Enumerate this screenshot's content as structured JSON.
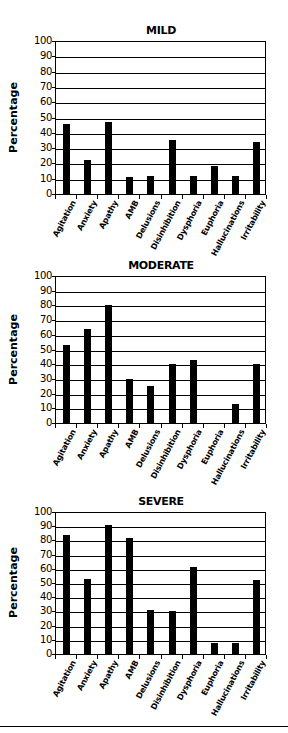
{
  "chart_data": [
    {
      "type": "bar",
      "title": "MILD",
      "xlabel": "",
      "ylabel": "Percentage",
      "ylim": [
        0,
        100
      ],
      "yticks": [
        0,
        10,
        20,
        30,
        40,
        50,
        60,
        70,
        80,
        90,
        100
      ],
      "grid": true,
      "categories": [
        "Agitation",
        "Anxiety",
        "Apathy",
        "AMB",
        "Delusions",
        "Disinhibition",
        "Dysphoria",
        "Euphoria",
        "Hallucinations",
        "Irritability"
      ],
      "values": [
        46,
        22,
        47,
        11,
        12,
        35,
        12,
        18,
        12,
        34
      ]
    },
    {
      "type": "bar",
      "title": "MODERATE",
      "xlabel": "",
      "ylabel": "Percentage",
      "ylim": [
        0,
        100
      ],
      "yticks": [
        0,
        10,
        20,
        30,
        40,
        50,
        60,
        70,
        80,
        90,
        100
      ],
      "grid": true,
      "categories": [
        "Agitation",
        "Anxiety",
        "Apathy",
        "AMB",
        "Delusions",
        "Disinhibition",
        "Dysphoria",
        "Euphoria",
        "Hallucinations",
        "Irritability"
      ],
      "values": [
        53,
        64,
        80,
        30,
        25,
        40,
        43,
        0,
        13,
        40
      ]
    },
    {
      "type": "bar",
      "title": "SEVERE",
      "xlabel": "",
      "ylabel": "Percentage",
      "ylim": [
        0,
        100
      ],
      "yticks": [
        0,
        10,
        20,
        30,
        40,
        50,
        60,
        70,
        80,
        90,
        100
      ],
      "grid": true,
      "categories": [
        "Agitation",
        "Anxiety",
        "Apathy",
        "AMB",
        "Delusions",
        "Disinhibition",
        "Dysphoria",
        "Euphoria",
        "Hallucinations",
        "Irritability"
      ],
      "values": [
        84,
        53,
        91,
        82,
        31,
        30,
        61,
        8,
        8,
        52
      ]
    }
  ],
  "colors": {
    "bar": "#000000",
    "grid": "#000000",
    "background": "#ffffff"
  }
}
